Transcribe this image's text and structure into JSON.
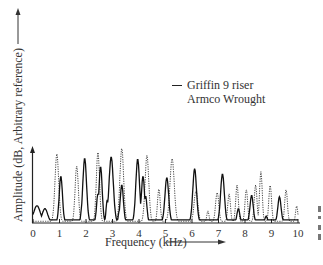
{
  "chart_data": {
    "type": "line",
    "title": "",
    "xlabel": "Frequency (kHz)",
    "ylabel": "Amplitude (dB, Arbitrary reference)",
    "x_ticks": [
      "0",
      "1",
      "2",
      "3",
      "4",
      "5",
      "6",
      "7",
      "8",
      "9",
      "10"
    ],
    "xlim": [
      0,
      10
    ],
    "ylim": [
      0,
      1
    ],
    "y_ticks": [],
    "grid": false,
    "legend_position": "upper-center",
    "series": [
      {
        "name": "Griffin 9 riser",
        "style": "solid",
        "peaks": [
          [
            0.15,
            0.22,
            0.12
          ],
          [
            0.45,
            0.18,
            0.1
          ],
          [
            1.05,
            0.62,
            0.06
          ],
          [
            1.85,
            0.22,
            0.04
          ],
          [
            1.95,
            0.86,
            0.07
          ],
          [
            2.45,
            0.38,
            0.05
          ],
          [
            2.55,
            0.75,
            0.06
          ],
          [
            2.8,
            0.3,
            0.04
          ],
          [
            2.95,
            0.88,
            0.08
          ],
          [
            3.25,
            0.15,
            0.03
          ],
          [
            3.35,
            0.5,
            0.06
          ],
          [
            3.95,
            0.85,
            0.07
          ],
          [
            4.15,
            0.62,
            0.06
          ],
          [
            4.25,
            0.35,
            0.05
          ],
          [
            5.05,
            0.6,
            0.07
          ],
          [
            6.1,
            0.72,
            0.07
          ],
          [
            7.15,
            0.65,
            0.07
          ],
          [
            7.75,
            0.18,
            0.05
          ],
          [
            8.25,
            0.36,
            0.06
          ],
          [
            8.8,
            0.08,
            0.04
          ],
          [
            9.3,
            0.34,
            0.06
          ]
        ]
      },
      {
        "name": "Armco Wrought",
        "style": "dotted",
        "peaks": [
          [
            0.9,
            0.92,
            0.07
          ],
          [
            1.65,
            0.76,
            0.06
          ],
          [
            2.45,
            0.95,
            0.06
          ],
          [
            3.35,
            1.0,
            0.07
          ],
          [
            4.3,
            0.9,
            0.07
          ],
          [
            4.75,
            0.45,
            0.05
          ],
          [
            5.25,
            0.86,
            0.08
          ],
          [
            6.15,
            0.42,
            0.07
          ],
          [
            6.6,
            0.15,
            0.04
          ],
          [
            6.95,
            0.4,
            0.06
          ],
          [
            7.4,
            0.38,
            0.05
          ],
          [
            7.7,
            0.5,
            0.05
          ],
          [
            8.05,
            0.44,
            0.05
          ],
          [
            8.4,
            0.5,
            0.05
          ],
          [
            8.6,
            0.68,
            0.05
          ],
          [
            8.95,
            0.5,
            0.05
          ],
          [
            9.55,
            0.44,
            0.05
          ],
          [
            9.95,
            0.22,
            0.04
          ]
        ]
      }
    ],
    "peak_format": "[frequency_kHz, relative_amplitude, width_kHz]"
  },
  "legend": {
    "items": [
      {
        "label": "Griffin 9 riser",
        "style": "solid"
      },
      {
        "label": "Armco Wrought",
        "style": "dotted"
      }
    ]
  }
}
